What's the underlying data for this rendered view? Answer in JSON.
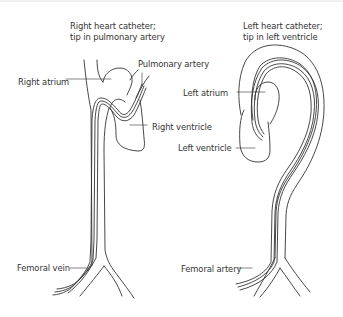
{
  "diagram": {
    "left_panel": {
      "title_line1": "Right heart catheter;",
      "title_line2": "tip in pulmonary artery",
      "labels": {
        "pulmonary_artery": "Pulmonary artery",
        "right_atrium": "Right atrium",
        "right_ventricle": "Right ventricle",
        "femoral_vein": "Femoral vein"
      }
    },
    "right_panel": {
      "title_line1": "Left heart catheter;",
      "title_line2": "tip in left ventricle",
      "labels": {
        "left_atrium": "Left atrium",
        "left_ventricle": "Left ventricle",
        "femoral_artery": "Femoral artery"
      }
    },
    "colors": {
      "stroke": "#333333",
      "text": "#333333",
      "background": "#ffffff"
    }
  }
}
